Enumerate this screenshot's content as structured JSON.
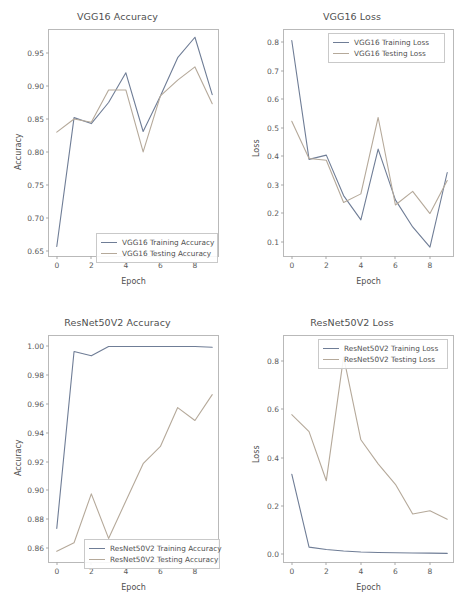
{
  "figure": {
    "width": 469,
    "height": 612,
    "background": "#ffffff",
    "layout": "2x2 grid of line charts"
  },
  "colors": {
    "training": "#6f7d96",
    "testing": "#b5a99a"
  },
  "chart_data": [
    {
      "id": "vgg16-accuracy",
      "type": "line",
      "title": "VGG16 Accuracy",
      "xlabel": "Epoch",
      "ylabel": "Accuracy",
      "x": [
        0,
        1,
        2,
        3,
        4,
        5,
        6,
        7,
        8,
        9
      ],
      "xlim": [
        -0.45,
        9.45
      ],
      "ylim": [
        0.6395,
        0.9855
      ],
      "xticks": [
        "0",
        "2",
        "4",
        "6",
        "8"
      ],
      "xtick_values": [
        0,
        2,
        4,
        6,
        8
      ],
      "yticks": [
        "0.65",
        "0.70",
        "0.75",
        "0.80",
        "0.85",
        "0.90",
        "0.95"
      ],
      "ytick_values": [
        0.65,
        0.7,
        0.75,
        0.8,
        0.85,
        0.9,
        0.95
      ],
      "grid": false,
      "legend_position": "lower center",
      "series": [
        {
          "name": "VGG16 Training Accuracy",
          "color": "#6f7d96",
          "values": [
            0.657,
            0.8525,
            0.8435,
            0.8755,
            0.9205,
            0.8315,
            0.8855,
            0.9435,
            0.9745,
            0.8875
          ]
        },
        {
          "name": "VGG16 Testing Accuracy",
          "color": "#b5a99a",
          "values": [
            0.8305,
            0.8505,
            0.8455,
            0.8945,
            0.8945,
            0.8005,
            0.8855,
            0.9095,
            0.9295,
            0.8735
          ]
        }
      ]
    },
    {
      "id": "vgg16-loss",
      "type": "line",
      "title": "VGG16 Loss",
      "xlabel": "Epoch",
      "ylabel": "Loss",
      "x": [
        0,
        1,
        2,
        3,
        4,
        5,
        6,
        7,
        8,
        9
      ],
      "xlim": [
        -0.45,
        9.45
      ],
      "ylim": [
        0.043,
        0.843
      ],
      "xticks": [
        "0",
        "2",
        "4",
        "6",
        "8"
      ],
      "xtick_values": [
        0,
        2,
        4,
        6,
        8
      ],
      "yticks": [
        "0.1",
        "0.2",
        "0.3",
        "0.4",
        "0.5",
        "0.6",
        "0.7",
        "0.8"
      ],
      "ytick_values": [
        0.1,
        0.2,
        0.3,
        0.4,
        0.5,
        0.6,
        0.7,
        0.8
      ],
      "grid": false,
      "legend_position": "upper center",
      "series": [
        {
          "name": "VGG16 Training Loss",
          "color": "#6f7d96",
          "values": [
            0.806,
            0.389,
            0.404,
            0.262,
            0.177,
            0.425,
            0.247,
            0.152,
            0.081,
            0.343
          ]
        },
        {
          "name": "VGG16 Testing Loss",
          "color": "#b5a99a",
          "values": [
            0.523,
            0.392,
            0.386,
            0.238,
            0.268,
            0.536,
            0.229,
            0.277,
            0.199,
            0.315
          ]
        }
      ]
    },
    {
      "id": "resnet50v2-accuracy",
      "type": "line",
      "title": "ResNet50V2 Accuracy",
      "xlabel": "Epoch",
      "ylabel": "Accuracy",
      "x": [
        0,
        1,
        2,
        3,
        4,
        5,
        6,
        7,
        8,
        9
      ],
      "xlim": [
        -0.45,
        9.45
      ],
      "ylim": [
        0.8487,
        1.0073
      ],
      "xticks": [
        "0",
        "2",
        "4",
        "6",
        "8"
      ],
      "xtick_values": [
        0,
        2,
        4,
        6,
        8
      ],
      "yticks": [
        "0.86",
        "0.88",
        "0.90",
        "0.92",
        "0.94",
        "0.96",
        "0.98",
        "1.00"
      ],
      "ytick_values": [
        0.86,
        0.88,
        0.9,
        0.92,
        0.94,
        0.96,
        0.98,
        1.0
      ],
      "grid": false,
      "legend_position": "lower center",
      "series": [
        {
          "name": "ResNet50V2 Training Accuracy",
          "color": "#6f7d96",
          "values": [
            0.8735,
            0.9965,
            0.9935,
            1.0,
            1.0,
            1.0,
            1.0,
            1.0,
            1.0,
            0.9995
          ]
        },
        {
          "name": "ResNet50V2 Testing Accuracy",
          "color": "#b5a99a",
          "values": [
            0.8575,
            0.8635,
            0.8975,
            0.8665,
            0.8925,
            0.9185,
            0.9305,
            0.9575,
            0.9485,
            0.9665
          ]
        }
      ]
    },
    {
      "id": "resnet50v2-loss",
      "type": "line",
      "title": "ResNet50V2 Loss",
      "xlabel": "Epoch",
      "ylabel": "Loss",
      "x": [
        0,
        1,
        2,
        3,
        4,
        5,
        6,
        7,
        8,
        9
      ],
      "xlim": [
        -0.45,
        9.45
      ],
      "ylim": [
        -0.042,
        0.905
      ],
      "xticks": [
        "0",
        "2",
        "4",
        "6",
        "8"
      ],
      "xtick_values": [
        0,
        2,
        4,
        6,
        8
      ],
      "yticks": [
        "0.0",
        "0.2",
        "0.4",
        "0.6",
        "0.8"
      ],
      "ytick_values": [
        0.0,
        0.2,
        0.4,
        0.6,
        0.8
      ],
      "grid": false,
      "legend_position": "upper center",
      "series": [
        {
          "name": "ResNet50V2 Training Loss",
          "color": "#6f7d96",
          "values": [
            0.331,
            0.028,
            0.018,
            0.012,
            0.008,
            0.006,
            0.005,
            0.004,
            0.003,
            0.002
          ]
        },
        {
          "name": "ResNet50V2 Testing Loss",
          "color": "#b5a99a",
          "values": [
            0.578,
            0.508,
            0.304,
            0.818,
            0.474,
            0.374,
            0.289,
            0.166,
            0.179,
            0.144
          ]
        }
      ]
    }
  ]
}
